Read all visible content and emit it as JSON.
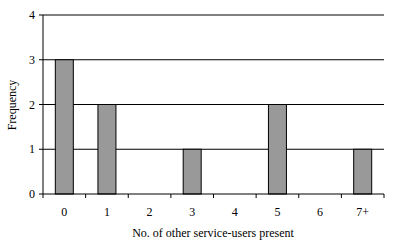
{
  "chart_data": {
    "type": "bar",
    "title": "",
    "xlabel": "No. of other service-users present",
    "ylabel": "Frequency",
    "categories": [
      "0",
      "1",
      "2",
      "3",
      "4",
      "5",
      "6",
      "7+"
    ],
    "values": [
      3,
      2,
      0,
      1,
      0,
      2,
      0,
      1
    ],
    "ylim": [
      0,
      4
    ],
    "yticks": [
      0,
      1,
      2,
      3,
      4
    ],
    "grid": true,
    "legend": null,
    "bar_color": "#999999"
  }
}
